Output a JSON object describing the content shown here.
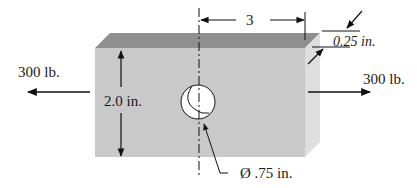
{
  "diagram": {
    "type": "mechanical-part-dimension-drawing",
    "part": "rectangular plate with central circular hole",
    "colors": {
      "front_face": "#c9c9c9",
      "top_face": "#8f8f8f",
      "side_face": "#dedede",
      "hole": "#ffffff",
      "lines": "#111111"
    },
    "labels": {
      "left_load": "300 lb.",
      "right_load": "300 lb.",
      "height": "2.0 in.",
      "half_width": "3",
      "thickness": "0.25 in.",
      "hole_diameter": "Ø .75 in."
    }
  }
}
